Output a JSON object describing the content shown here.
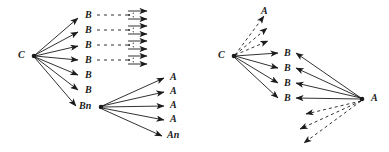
{
  "figure": {
    "type": "graph-diagram",
    "background": "#ffffff",
    "stroke_color": "#1b1b1b",
    "label_color": "#1b1b1b",
    "panels": [
      {
        "id": "left-panel",
        "name": "left-diagram",
        "root": {
          "label": "C",
          "x": 22,
          "y": 56
        },
        "branch_labels": [
          {
            "label": "B",
            "x": 86,
            "y": 18
          },
          {
            "label": "B",
            "x": 86,
            "y": 33
          },
          {
            "label": "B",
            "x": 86,
            "y": 48
          },
          {
            "label": "B",
            "x": 86,
            "y": 63
          },
          {
            "label": "B",
            "x": 86,
            "y": 78
          },
          {
            "label": "B",
            "x": 86,
            "y": 93
          },
          {
            "label": "Bn",
            "x": 84,
            "y": 110
          }
        ],
        "leaf_labels": [
          {
            "label": "A",
            "x": 172,
            "y": 80
          },
          {
            "label": "A",
            "x": 172,
            "y": 94
          },
          {
            "label": "A",
            "x": 172,
            "y": 108
          },
          {
            "label": "A",
            "x": 172,
            "y": 122
          },
          {
            "label": "An",
            "x": 170,
            "y": 139
          }
        ],
        "dashed_rows": 4,
        "dashed_row_ys": [
          18,
          33,
          48,
          63
        ]
      },
      {
        "id": "right-panel",
        "name": "right-diagram",
        "root": {
          "label": "C",
          "x": 222,
          "y": 56
        },
        "sink": {
          "label": "A",
          "x": 372,
          "y": 99
        },
        "branch_labels": [
          {
            "label": "B",
            "x": 285,
            "y": 56
          },
          {
            "label": "B",
            "x": 285,
            "y": 71
          },
          {
            "label": "B",
            "x": 285,
            "y": 86
          },
          {
            "label": "B",
            "x": 285,
            "y": 100
          }
        ],
        "top_label": {
          "label": "A",
          "x": 262,
          "y": 14
        },
        "dashed_out_count": 3,
        "dashed_in_count": 3
      }
    ]
  }
}
